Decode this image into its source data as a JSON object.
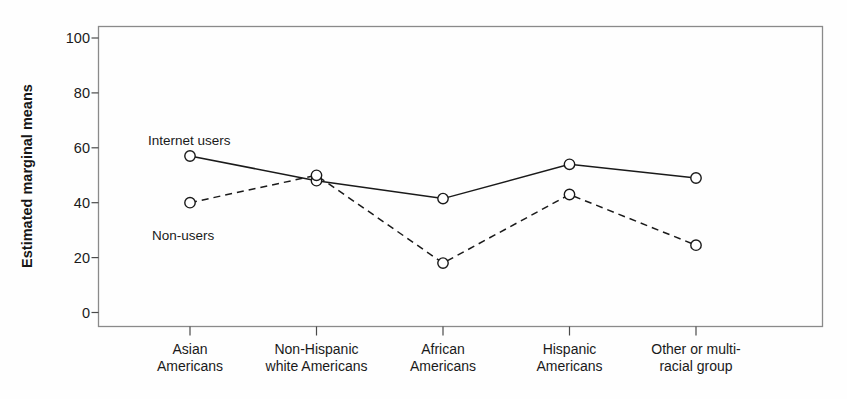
{
  "chart_data": {
    "type": "line",
    "title": "",
    "xlabel": "",
    "ylabel": "Estimated marginal means",
    "ylim": [
      0,
      100
    ],
    "yticks": [
      0,
      20,
      40,
      60,
      80,
      100
    ],
    "grid": false,
    "legend_position": "inline-annotations",
    "categories": [
      "Asian\nAmericans",
      "Non-Hispanic\nwhite Americans",
      "African\nAmericans",
      "Hispanic\nAmericans",
      "Other or multi-\nracial group"
    ],
    "category_lines": [
      [
        "Asian",
        "Americans"
      ],
      [
        "Non-Hispanic",
        "white Americans"
      ],
      [
        "African",
        "Americans"
      ],
      [
        "Hispanic",
        "Americans"
      ],
      [
        "Other or multi-",
        "racial group"
      ]
    ],
    "series": [
      {
        "name": "Internet users",
        "style": "solid",
        "marker": "open-circle",
        "color": "#1a1a1a",
        "values": [
          57,
          48,
          41.5,
          54,
          49
        ]
      },
      {
        "name": "Non-users",
        "style": "dashed",
        "marker": "open-circle",
        "color": "#1a1a1a",
        "values": [
          40,
          50,
          18,
          43,
          24.5
        ]
      }
    ],
    "annotations": [
      {
        "text": "Internet users",
        "x_px": 148,
        "y_px": 133
      },
      {
        "text": "Non-users",
        "x_px": 152,
        "y_px": 228
      }
    ]
  },
  "axis": {
    "y_tick_labels": [
      "100",
      "80",
      "60",
      "40",
      "20",
      "0"
    ],
    "y_title": "Estimated marginal means"
  },
  "colors": {
    "line": "#1a1a1a",
    "frame": "#8a8a8a",
    "marker_fill": "#ffffff",
    "background": "#fefefe"
  }
}
